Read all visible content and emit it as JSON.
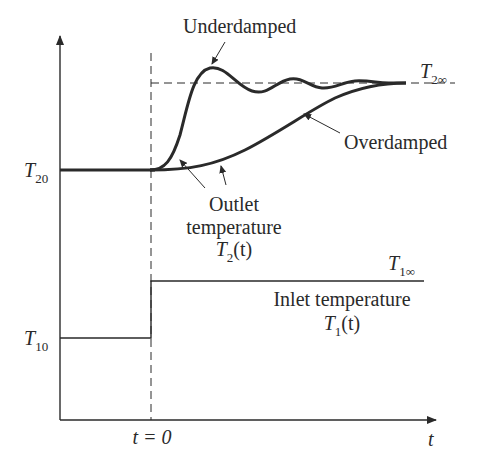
{
  "diagram": {
    "type": "step-response",
    "axes": {
      "x_label": "t",
      "y_arrow": true,
      "origin_marker": "t = 0"
    },
    "y_levels": {
      "T20": {
        "sym": "T",
        "sub": "20"
      },
      "T10": {
        "sym": "T",
        "sub": "10"
      },
      "T2inf": {
        "sym": "T",
        "sub": "2∞"
      },
      "T1inf": {
        "sym": "T",
        "sub": "1∞"
      }
    },
    "curves": [
      {
        "name": "Underdamped",
        "label": "Underdamped"
      },
      {
        "name": "Overdamped",
        "label": "Overdamped"
      }
    ],
    "outlet": {
      "line1": "Outlet",
      "line2": "temperature",
      "sym": "T",
      "sub": "2",
      "arg": "(t)"
    },
    "inlet": {
      "line1": "Inlet temperature",
      "sym": "T",
      "sub": "1",
      "arg": "(t)"
    },
    "colors": {
      "line": "#2a2a2a",
      "background": "#ffffff"
    }
  }
}
